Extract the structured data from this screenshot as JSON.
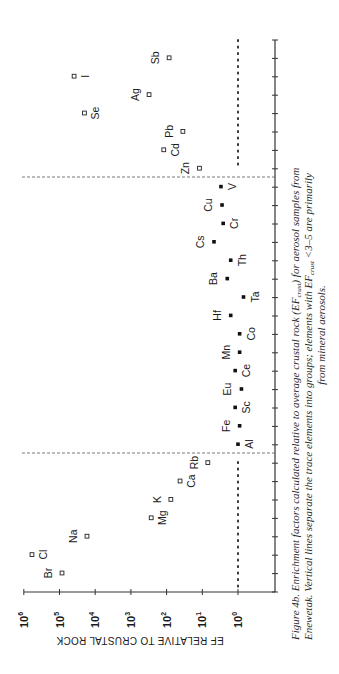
{
  "chart_data": {
    "type": "scatter",
    "orientation": "rotated-90-ccw",
    "title": "",
    "xlabel": "Element",
    "ylabel": "EF RELATIVE TO CRUSTAL ROCK",
    "yscale": "log",
    "ylim": [
      1,
      1000000
    ],
    "y_ticks": [
      "10^6",
      "10^5",
      "10^4",
      "10^3",
      "10^2",
      "10^1",
      "10^0"
    ],
    "reference_line": {
      "value": 1,
      "style": "dotted",
      "applies_to_groups": [
        "marine",
        "anthropogenic"
      ]
    },
    "group_dividers": [
      "between Rb and Al",
      "between V and Zn"
    ],
    "groups": [
      {
        "name": "marine",
        "marker": "open-square",
        "points": [
          {
            "element": "Br",
            "ef": 85000
          },
          {
            "element": "Cl",
            "ef": 590000
          },
          {
            "element": "Na",
            "ef": 17000
          },
          {
            "element": "Mg",
            "ef": 270
          },
          {
            "element": "K",
            "ef": 76
          },
          {
            "element": "Ca",
            "ef": 42
          },
          {
            "element": "Rb",
            "ef": 7
          }
        ]
      },
      {
        "name": "crustal",
        "marker": "filled-square",
        "points": [
          {
            "element": "Al",
            "ef": 1.0
          },
          {
            "element": "Fe",
            "ef": 0.9
          },
          {
            "element": "Sc",
            "ef": 1.2
          },
          {
            "element": "Eu",
            "ef": 0.8
          },
          {
            "element": "Ce",
            "ef": 1.2
          },
          {
            "element": "Mn",
            "ef": 0.9
          },
          {
            "element": "Co",
            "ef": 0.9
          },
          {
            "element": "Hf",
            "ef": 1.6
          },
          {
            "element": "Ta",
            "ef": 0.7
          },
          {
            "element": "Ba",
            "ef": 2.0
          },
          {
            "element": "Th",
            "ef": 1.6
          },
          {
            "element": "Cs",
            "ef": 4.7
          },
          {
            "element": "Cr",
            "ef": 2.6
          },
          {
            "element": "Cu",
            "ef": 2.8
          },
          {
            "element": "V",
            "ef": 3.0
          }
        ]
      },
      {
        "name": "anthropogenic",
        "marker": "open-square",
        "points": [
          {
            "element": "Zn",
            "ef": 12
          },
          {
            "element": "Cd",
            "ef": 120
          },
          {
            "element": "Pb",
            "ef": 35
          },
          {
            "element": "Se",
            "ef": 20000
          },
          {
            "element": "Ag",
            "ef": 310
          },
          {
            "element": "I",
            "ef": 39000
          },
          {
            "element": "Sb",
            "ef": 85
          }
        ]
      }
    ],
    "caption": "Figure 4b. Enrichment factors calculated relative to average crustal rock (EF_crust) for aerosol samples from Enewetak. Vertical lines separate the trace elements into groups; elements with EF_crust <3–5 are primarily from mineral aerosols."
  },
  "axis": {
    "title": "EF RELATIVE TO CRUSTAL ROCK",
    "ticks": [
      {
        "base": "10",
        "exp": "6"
      },
      {
        "base": "10",
        "exp": "5"
      },
      {
        "base": "10",
        "exp": "4"
      },
      {
        "base": "10",
        "exp": "3"
      },
      {
        "base": "10",
        "exp": "2"
      },
      {
        "base": "10",
        "exp": "1"
      },
      {
        "base": "10",
        "exp": "0"
      }
    ]
  },
  "caption": {
    "line1": "Figure 4b.  Enrichment factors calculated relative to average crustal rock (EF",
    "line1_sub": "crust",
    "line1_end": ") for aerosol samples from",
    "line2": "Enewetak.  Vertical lines separate the trace elements into groups; elements with EF",
    "line2_sub": "crust",
    "line2_end": " <3–5 are primarily",
    "line3": "from mineral aerosols."
  }
}
